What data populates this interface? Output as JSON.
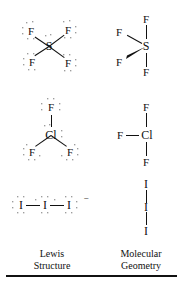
{
  "figure": {
    "columns": [
      {
        "id": "lewis",
        "line1": "Lewis",
        "line2": "Structure"
      },
      {
        "id": "geometry",
        "line1": "Molecular",
        "line2": "Geometry"
      }
    ],
    "ink_color": "#111111",
    "background_color": "#ffffff"
  },
  "rows": [
    {
      "id": "sf4",
      "lewis": {
        "center": "S",
        "terminals": [
          "F",
          "F",
          "F",
          "F"
        ],
        "center_lone_pairs": 1,
        "terminal_lone_pairs": 3,
        "charge": ""
      },
      "geometry": {
        "center": "S",
        "terminals": [
          "F",
          "F",
          "F",
          "F"
        ],
        "shape": "seesaw"
      }
    },
    {
      "id": "clf3",
      "lewis": {
        "center": "Cl",
        "terminals": [
          "F",
          "F",
          "F"
        ],
        "center_lone_pairs": 2,
        "terminal_lone_pairs": 3,
        "charge": ""
      },
      "geometry": {
        "center": "Cl",
        "terminals": [
          "F",
          "F",
          "F"
        ],
        "shape": "t-shaped"
      }
    },
    {
      "id": "i3",
      "lewis": {
        "center": "I",
        "terminals": [
          "I",
          "I"
        ],
        "center_lone_pairs": 3,
        "terminal_lone_pairs": 3,
        "charge": "−"
      },
      "geometry": {
        "center": "I",
        "terminals": [
          "I",
          "I"
        ],
        "shape": "linear"
      }
    }
  ],
  "labels": {
    "sf4_lewis_center": "S",
    "sf4_lewis_f_tl": "F",
    "sf4_lewis_f_tr": "F",
    "sf4_lewis_f_bl": "F",
    "sf4_lewis_f_br": "F",
    "sf4_geom_center": "S",
    "sf4_geom_f_top": "F",
    "sf4_geom_f_left": "F",
    "sf4_geom_f_wedge": "F",
    "sf4_geom_f_bottom": "F",
    "clf3_lewis_center": "Cl",
    "clf3_lewis_f_top": "F",
    "clf3_lewis_f_bl": "F",
    "clf3_lewis_f_br": "F",
    "clf3_geom_center": "Cl",
    "clf3_geom_f_top": "F",
    "clf3_geom_f_left": "F",
    "clf3_geom_f_bottom": "F",
    "i3_lewis_left": "I",
    "i3_lewis_center": "I",
    "i3_lewis_right": "I",
    "i3_lewis_charge": "−",
    "i3_geom_top": "I",
    "i3_geom_center": "I",
    "i3_geom_bottom": "I",
    "caption_left_1": "Lewis",
    "caption_left_2": "Structure",
    "caption_right_1": "Molecular",
    "caption_right_2": "Geometry"
  }
}
